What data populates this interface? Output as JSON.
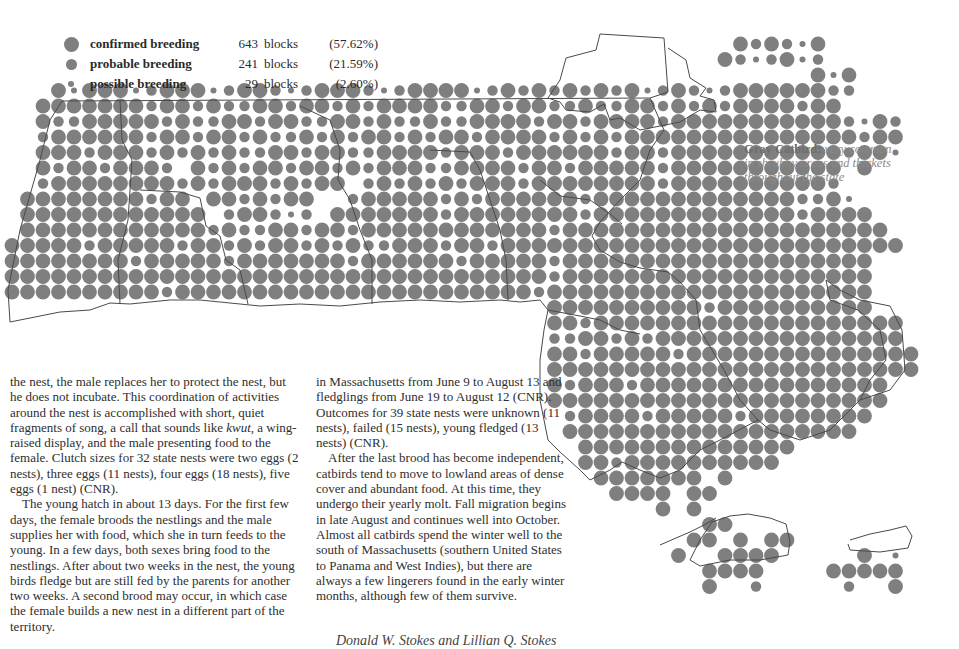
{
  "legend": {
    "items": [
      {
        "label": "confirmed breeding",
        "count": "643",
        "unit": "blocks",
        "percent": "(57.62%)",
        "size": 15
      },
      {
        "label": "probable breeding",
        "count": "241",
        "unit": "blocks",
        "percent": "(21.59%)",
        "size": 11
      },
      {
        "label": "possible breeding",
        "count": "29",
        "unit": "blocks",
        "percent": "(2.60%)",
        "size": 6
      }
    ]
  },
  "caption": {
    "species": "Gray Catbird:",
    "description": "very common in shrubby areas and thickets throughout the state"
  },
  "text": {
    "left_column": [
      "the nest, the male replaces her to protect the nest, but he does not incubate. This coordination of activities around the nest is accomplished with short, quiet fragments of song, a call that sounds like ",
      "kwut,",
      " a wing-raised display, and the male presenting food to the female. Clutch sizes for 32 state nests were two eggs (2 nests), three eggs (11 nests), four eggs (18 nests), five eggs (1 nest) (CNR).",
      "The young hatch in about 13 days. For the first few days, the female broods the nestlings and the male supplies her with food, which she in turn feeds to the young. In a few days, both sexes bring food to the nestlings. After about two weeks in the nest, the young birds fledge but are still fed by the parents for another two weeks. A second brood may occur, in which case the female builds a new nest in a different part of the territory."
    ],
    "mid_column": [
      "in Massachusetts from June 9 to August 13 and fledglings from June 19 to August 12 (CNR). Outcomes for 39 state nests were unknown (11 nests), failed (15 nests), young fledged (13 nests) (CNR).",
      "After the last brood has become independent, catbirds tend to move to lowland areas of dense cover and abundant food. At this time, they undergo their yearly molt. Fall migration begins in late August and continues well into October. Almost all catbirds spend the winter well to the south of Massachusetts (southern United States to Panama and West Indies), but there are always a few lingerers found in the early winter months, although few of them survive."
    ],
    "signature": "Donald W. Stokes and Lillian Q. Stokes"
  },
  "map": {
    "dot_color": "#7f7f7f",
    "border_color": "#4a4a4a",
    "grid": {
      "origin_x": 12,
      "origin_y": 44,
      "pitch": 15.5
    },
    "radius": {
      "L": 7.4,
      "M": 5.2,
      "S": 3.0
    },
    "rows": [
      "...............................................LMLMSL......",
      "..............................................LMSMLSM.....",
      "....................................................LSL...",
      "...LSLLLSMLLLSMLLMSMLLLMSMLLLLSMLMLMLMLMLSMLMSMLLLLLLMM...",
      "..LLLLLLLMLLMLMMLLMLLMLMLLLLMMLLMLLMMLMMLLMLMLMLLLLMLL....",
      "..LMMLLLLLMLMMLLMLLMMLLMLMMLMMLLLLMLLMLLLLMLLLLLLLLLLLMSLM.",
      "..MLLLLLLMLLMLLMLMMLMLMLLMLMLLMLLLLMLMLMLLLLLLLLLLLLLLLMLL.",
      "..LLLMLLLMLMLMLMMLLMLLMMLLLLMLLLMLLLLLLMLLMLLLLLLLLLLLMLLS.",
      "..LMLLMLLLM.LMLMLLMLLMLMLLLMMLLLLMLLMLLLLLMLLLLLLLLLLL.L...",
      "..MLLLLLLLLMLMLLLMLMLL.MLMLMLMLLLMLLLLLLLLMLLLLLLLLLLM.....",
      ".LLLLLLLLMLL.LLMLMLL..MLLLLLMLMLLLLLLMLLLLLLLLLLLLLMMLS....",
      ".LLLLLLLLLLLL.MLLMSM.LLLLLLLMLLLLLLLLMLLLLLLLLLLLLLMLLLL...",
      ".LLLLLLLLLLLLMLMMLLMLLMLLLLLLLLLLLLMLLLLLLLLLLLLLLLLLLLLL..",
      "LLLLLMLLLLLMLLMLMLLMLMLMMLLLMLLMLLLLLLLLLLLLLLLLLLLLLLLLLL.",
      "LLLLLLLLMLLLLLMLLLLLLLMLLLLLLMLLLLLMLLLLLLLLLLLLLLLLLLLL...",
      "LLLLLLLLLLLLLLLLLLLLLLLLLLLLLLLLLLLMLLLLLLLLLLLLLLLLLLLL...",
      "LLLLLLLLLLMLLLLLLLLLLLLLLLLLLLLLLLMLLLLLLLLLLLLLLLLLLLLL..",
      "...................................LLLLLLLLLLMLLLLLLLLLL...",
      "...................................LLMLLLLLLLLLLLLLLLLLLLL.",
      "...................................MMLLMLMLLLLLLLLLLLLLLLL.",
      "...................................LLMLLLLLMLLLLLLLLLLLLLLL",
      "...................................LLLLLLLLLLLLLLLLLLLLLLLL",
      "...................................LMLLLMLLLLLLLLLLLLLLLL..",
      "...................................LLLLLLLLLLLLLLLLLLLLLL..",
      "....................................MLLLLMLLLLLMLLLLLLLL...",
      "....................................LLLLLLLLLLLLLLLLLLL....",
      ".....................................LLLLLLLLLLLLLL.........",
      ".....................................LLMLLLLLLLLLL.........",
      "......................................LLLLLLL.L............",
      ".......................................LLLL.LL.............",
      "..........................................L.L..............",
      ".............................................LL............",
      "............................................LL.L.LL.......",
      "...........................................L..LLLL.....L.S.",
      ".............................................LLLL....LLLLL.",
      ".............................................L..M.....M..L."
    ]
  }
}
